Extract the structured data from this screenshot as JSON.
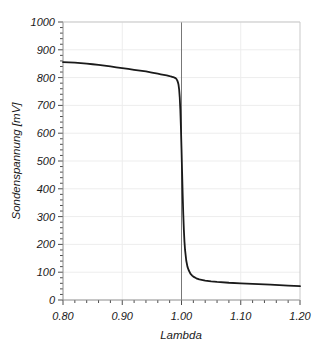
{
  "chart_data": {
    "type": "line",
    "title": "",
    "subtitle": "",
    "xlabel": "Lambda",
    "ylabel": "Sondenspannung [mV]",
    "xlim": [
      0.8,
      1.2
    ],
    "ylim": [
      0,
      1000
    ],
    "grid": true,
    "legend": "none",
    "x_ticks": [
      "0.80",
      "0.90",
      "1.00",
      "1.10",
      "1.20"
    ],
    "x_tick_values": [
      0.8,
      0.9,
      1.0,
      1.1,
      1.2
    ],
    "x_minor_ticks_between": 4,
    "y_ticks": [
      "0",
      "100",
      "200",
      "300",
      "400",
      "500",
      "600",
      "700",
      "800",
      "900",
      "1000"
    ],
    "y_tick_values": [
      0,
      100,
      200,
      300,
      400,
      500,
      600,
      700,
      800,
      900,
      1000
    ],
    "y_minor_ticks_between": 4,
    "annotations": [
      {
        "name": "stoichiometric-reference-line",
        "type": "vline",
        "x": 1.0,
        "color": "#777777"
      }
    ],
    "series": [
      {
        "name": "Sondenspannung",
        "color": "#1a1a1a",
        "line_width": 1.8,
        "x": [
          0.8,
          0.81,
          0.82,
          0.83,
          0.84,
          0.85,
          0.86,
          0.87,
          0.88,
          0.89,
          0.9,
          0.91,
          0.92,
          0.93,
          0.94,
          0.95,
          0.955,
          0.96,
          0.965,
          0.97,
          0.975,
          0.98,
          0.982,
          0.984,
          0.986,
          0.988,
          0.99,
          0.991,
          0.992,
          0.993,
          0.994,
          0.995,
          0.996,
          0.997,
          0.998,
          0.999,
          1.0,
          1.001,
          1.002,
          1.003,
          1.004,
          1.005,
          1.006,
          1.008,
          1.01,
          1.012,
          1.015,
          1.018,
          1.02,
          1.025,
          1.03,
          1.04,
          1.05,
          1.06,
          1.08,
          1.1,
          1.12,
          1.15,
          1.18,
          1.2
        ],
        "y": [
          856,
          855,
          854,
          852,
          850,
          848,
          846,
          843,
          840,
          837,
          834,
          831,
          828,
          825,
          822,
          818,
          816,
          814,
          812,
          810,
          808,
          805,
          804,
          803,
          802,
          800,
          798,
          796,
          793,
          789,
          783,
          774,
          758,
          730,
          686,
          622,
          545,
          460,
          378,
          308,
          252,
          210,
          180,
          142,
          120,
          108,
          95,
          88,
          84,
          78,
          74,
          70,
          67,
          65,
          62,
          60,
          58,
          55,
          52,
          50
        ]
      }
    ]
  },
  "figure": {
    "background": "#ffffff",
    "plot_background": "#ffffff",
    "grid_color": "#ededed",
    "axis_color": "#8c8c8c",
    "tick_color": "#4d4d4d",
    "text_color": "#1a1a1a"
  }
}
